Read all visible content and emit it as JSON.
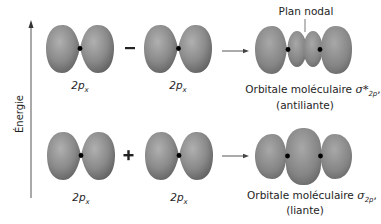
{
  "axis": {
    "label": "Énergie",
    "direction": "up"
  },
  "rows": [
    {
      "name": "antibonding",
      "left_orbital_label": {
        "main": "2p",
        "sub": "x"
      },
      "operator": "−",
      "right_orbital_label": {
        "main": "2p",
        "sub": "x"
      },
      "result": {
        "prefix": "Orbitale moléculaire ",
        "symbol": "σ*",
        "sub": "2p",
        "suffix": ",",
        "type_label": "(antiliante)"
      },
      "annotation": "Plan nodal"
    },
    {
      "name": "bonding",
      "left_orbital_label": {
        "main": "2p",
        "sub": "x"
      },
      "operator": "+",
      "right_orbital_label": {
        "main": "2p",
        "sub": "x"
      },
      "result": {
        "prefix": "Orbitale moléculaire ",
        "symbol": "σ",
        "sub": "2p",
        "suffix": ",",
        "type_label": "(liante)"
      }
    }
  ],
  "colors": {
    "lobe_light": "#a6a6a6",
    "lobe_dark": "#5e5e5e",
    "nucleus": "#000000",
    "line": "#555555"
  }
}
